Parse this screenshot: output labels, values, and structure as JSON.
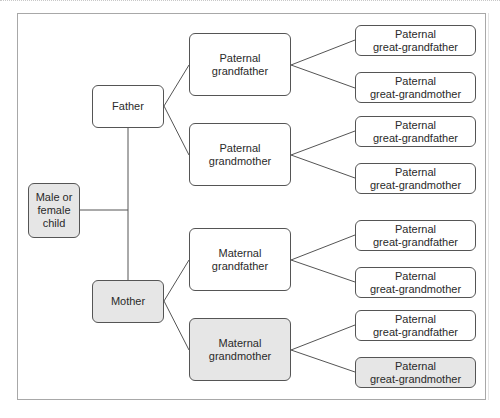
{
  "diagram": {
    "type": "family-tree",
    "colors": {
      "highlight_fill": "#e6e6e6",
      "normal_fill": "#ffffff",
      "border": "#555555",
      "line": "#555555"
    },
    "nodes": {
      "child": {
        "label": "Male or\nfemale\nchild",
        "highlighted": true
      },
      "father": {
        "label": "Father",
        "highlighted": false
      },
      "mother": {
        "label": "Mother",
        "highlighted": true
      },
      "paternal_grandfather": {
        "label": "Paternal\ngrandfather",
        "highlighted": false
      },
      "paternal_grandmother": {
        "label": "Paternal\ngrandmother",
        "highlighted": false
      },
      "maternal_grandfather": {
        "label": "Maternal\ngrandfather",
        "highlighted": false
      },
      "maternal_grandmother": {
        "label": "Maternal\ngrandmother",
        "highlighted": true
      },
      "great_1": {
        "label": "Paternal\ngreat-grandfather",
        "highlighted": false
      },
      "great_2": {
        "label": "Paternal\ngreat-grandmother",
        "highlighted": false
      },
      "great_3": {
        "label": "Paternal\ngreat-grandfather",
        "highlighted": false
      },
      "great_4": {
        "label": "Paternal\ngreat-grandmother",
        "highlighted": false
      },
      "great_5": {
        "label": "Paternal\ngreat-grandfather",
        "highlighted": false
      },
      "great_6": {
        "label": "Paternal\ngreat-grandmother",
        "highlighted": false
      },
      "great_7": {
        "label": "Paternal\ngreat-grandfather",
        "highlighted": false
      },
      "great_8": {
        "label": "Paternal\ngreat-grandmother",
        "highlighted": true
      }
    }
  }
}
